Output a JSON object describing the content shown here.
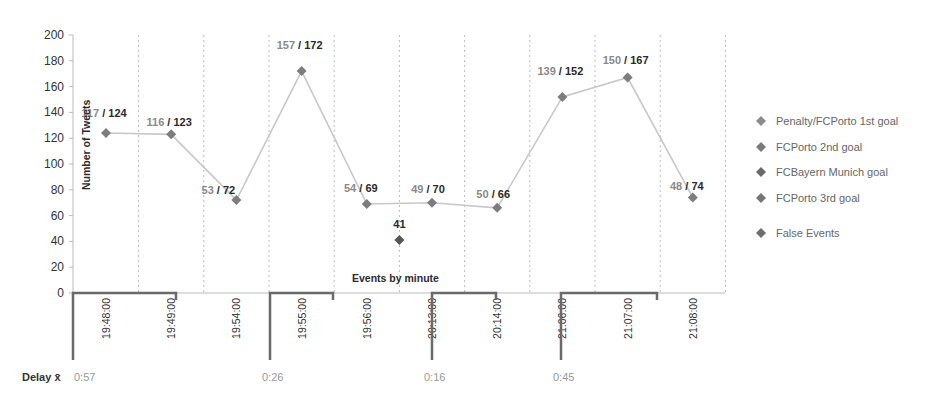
{
  "chart_data": {
    "type": "line",
    "title": "",
    "xlabel": "Events by minute",
    "ylabel": "Number of Tweets",
    "ylim": [
      0,
      200
    ],
    "yticks": [
      0,
      20,
      40,
      60,
      80,
      100,
      120,
      140,
      160,
      180,
      200
    ],
    "grid": "vertical dashed",
    "legend_position": "right",
    "categories": [
      "19:48:00",
      "19:49:00",
      "19:54:00",
      "19:55:00",
      "19:56:00",
      "20:13:00",
      "20:14:00",
      "21:06:00",
      "21:07:00",
      "21:08:00"
    ],
    "series": [
      {
        "name": "Tweets (line)",
        "values": [
          124,
          123,
          72,
          172,
          69,
          70,
          66,
          152,
          167,
          74
        ],
        "labels_first": [
          117,
          116,
          53,
          157,
          54,
          49,
          50,
          139,
          150,
          48
        ],
        "labels_second": [
          124,
          123,
          72,
          172,
          69,
          70,
          66,
          152,
          167,
          74
        ]
      },
      {
        "name": "False Events",
        "points": [
          {
            "x_between": [
              "19:56:00",
              "20:13:00"
            ],
            "value": 41
          }
        ]
      }
    ],
    "data_labels": [
      "117 / 124",
      "116 / 123",
      "53 / 72",
      "157 / 172",
      "54 / 69",
      "49 / 70",
      "50 / 66",
      "139 / 152",
      "150 / 167",
      "48 / 74",
      "41"
    ],
    "legend": [
      {
        "label": "Penalty/FCPorto  1st goal",
        "color": "#8c8c8c"
      },
      {
        "label": "FCPorto 2nd goal",
        "color": "#7a7a7a"
      },
      {
        "label": "FCBayern  Munich goal",
        "color": "#6a6a6a"
      },
      {
        "label": "FCPorto 3rd goal",
        "color": "#777777"
      },
      {
        "label": "False Events",
        "color": "#6e6e6e"
      }
    ],
    "event_brackets": [
      {
        "from": "19:48:00",
        "to": "19:49:00",
        "delay": "0:57"
      },
      {
        "from": "19:55:00",
        "to": "19:56:00",
        "delay": "0:26"
      },
      {
        "from": "20:13:00",
        "to": "20:14:00",
        "delay": "0:16"
      },
      {
        "from": "21:06:00",
        "to": "21:07:00",
        "delay": "0:45"
      }
    ],
    "delay_label": "Delay x̄"
  },
  "colors": {
    "line": "#c8c8c8",
    "marker": "#7d7d7d",
    "bracket": "#6a6a6a",
    "grid": "#bdbdbd"
  }
}
